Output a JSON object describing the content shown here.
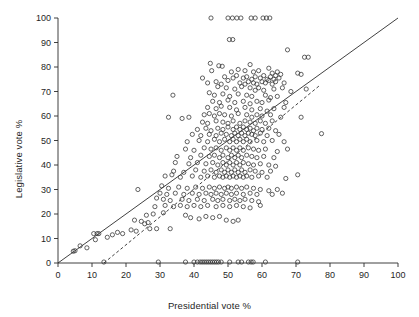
{
  "figure": {
    "background": "#ffffff",
    "ink_color": "#2b2b2b"
  },
  "axes": {
    "x_title": "Presidential vote %",
    "y_title": "Legislative vote %"
  },
  "chart_data": {
    "type": "scatter",
    "title": "",
    "xlabel": "Presidential vote %",
    "ylabel": "Legislative vote %",
    "xlim": [
      0,
      100
    ],
    "ylim": [
      0,
      100
    ],
    "xticks": [
      0,
      10,
      20,
      30,
      40,
      50,
      60,
      70,
      80,
      90,
      100
    ],
    "yticks": [
      0,
      10,
      20,
      30,
      40,
      50,
      60,
      70,
      80,
      90,
      100
    ],
    "xtick_labels": [
      "0",
      "10",
      "20",
      "30",
      "40",
      "50",
      "60",
      "70",
      "80",
      "90",
      "100"
    ],
    "ytick_labels": [
      "0",
      "10",
      "20",
      "30",
      "40",
      "50",
      "60",
      "70",
      "80",
      "90",
      "100"
    ],
    "grid": false,
    "legend": null,
    "marker": {
      "shape": "open-circle",
      "size_px": 4.2,
      "edge_color": "#3a3a3a",
      "fill": "none"
    },
    "reference_lines": [
      {
        "name": "identity-line",
        "style": "solid",
        "color": "#2b2b2b",
        "x": [
          0,
          100
        ],
        "y": [
          0,
          100
        ],
        "slope": 1.0,
        "intercept": 0.0
      },
      {
        "name": "regression-line",
        "style": "dashed",
        "color": "#2b2b2b",
        "x": [
          13.5,
          77.0
        ],
        "y": [
          0.0,
          72.5
        ],
        "slope": 1.142,
        "intercept": -15.4
      }
    ],
    "points": [
      [
        45.0,
        100
      ],
      [
        50.0,
        100
      ],
      [
        51.3,
        100
      ],
      [
        52.6,
        100
      ],
      [
        53.8,
        100
      ],
      [
        56.8,
        100
      ],
      [
        58.0,
        100
      ],
      [
        60.3,
        100
      ],
      [
        61.3,
        100
      ],
      [
        62.3,
        100
      ],
      [
        50.4,
        91.2
      ],
      [
        51.4,
        91.2
      ],
      [
        67.5,
        87.0
      ],
      [
        72.5,
        84.0
      ],
      [
        73.6,
        84.0
      ],
      [
        44.8,
        81.5
      ],
      [
        47.3,
        80.5
      ],
      [
        48.3,
        80.3
      ],
      [
        56.5,
        81.0
      ],
      [
        45.2,
        78.5
      ],
      [
        51.0,
        78.0
      ],
      [
        53.0,
        79.0
      ],
      [
        55.0,
        78.5
      ],
      [
        57.5,
        78.0
      ],
      [
        59.0,
        78.5
      ],
      [
        62.0,
        79.5
      ],
      [
        63.0,
        77.5
      ],
      [
        64.5,
        78.0
      ],
      [
        65.5,
        77.0
      ],
      [
        70.5,
        77.5
      ],
      [
        71.5,
        77.0
      ],
      [
        49.0,
        76.0
      ],
      [
        51.5,
        75.5
      ],
      [
        52.5,
        76.5
      ],
      [
        54.5,
        75.5
      ],
      [
        55.5,
        76.0
      ],
      [
        57.0,
        75.0
      ],
      [
        58.0,
        76.0
      ],
      [
        59.5,
        75.5
      ],
      [
        60.5,
        76.5
      ],
      [
        61.5,
        75.0
      ],
      [
        62.5,
        76.0
      ],
      [
        63.5,
        75.0
      ],
      [
        64.0,
        76.5
      ],
      [
        65.0,
        75.5
      ],
      [
        42.5,
        75.5
      ],
      [
        44.0,
        73.5
      ],
      [
        46.5,
        74.0
      ],
      [
        48.0,
        73.0
      ],
      [
        50.0,
        74.5
      ],
      [
        53.5,
        73.5
      ],
      [
        55.0,
        73.0
      ],
      [
        56.0,
        74.0
      ],
      [
        57.5,
        73.5
      ],
      [
        58.5,
        73.0
      ],
      [
        60.0,
        74.0
      ],
      [
        61.0,
        73.5
      ],
      [
        62.0,
        74.5
      ],
      [
        63.0,
        73.0
      ],
      [
        64.0,
        74.0
      ],
      [
        66.5,
        73.5
      ],
      [
        47.0,
        72.0
      ],
      [
        49.5,
        71.5
      ],
      [
        52.0,
        71.0
      ],
      [
        54.0,
        72.0
      ],
      [
        56.5,
        71.5
      ],
      [
        58.0,
        70.5
      ],
      [
        59.0,
        71.5
      ],
      [
        60.5,
        70.5
      ],
      [
        63.5,
        71.0
      ],
      [
        66.0,
        71.5
      ],
      [
        68.5,
        70.0
      ],
      [
        73.0,
        71.0
      ],
      [
        33.8,
        68.5
      ],
      [
        44.5,
        69.5
      ],
      [
        46.0,
        68.5
      ],
      [
        48.5,
        69.0
      ],
      [
        50.5,
        68.0
      ],
      [
        53.0,
        69.0
      ],
      [
        55.5,
        68.5
      ],
      [
        57.0,
        68.0
      ],
      [
        61.0,
        68.5
      ],
      [
        62.5,
        67.5
      ],
      [
        64.5,
        68.0
      ],
      [
        45.5,
        66.0
      ],
      [
        47.5,
        65.5
      ],
      [
        50.0,
        66.5
      ],
      [
        52.0,
        65.5
      ],
      [
        54.5,
        66.0
      ],
      [
        56.5,
        65.0
      ],
      [
        58.5,
        66.0
      ],
      [
        60.0,
        65.5
      ],
      [
        62.0,
        66.5
      ],
      [
        67.0,
        65.5
      ],
      [
        44.0,
        63.5
      ],
      [
        46.5,
        63.0
      ],
      [
        48.0,
        64.0
      ],
      [
        50.5,
        63.5
      ],
      [
        52.5,
        62.5
      ],
      [
        55.0,
        63.5
      ],
      [
        57.0,
        62.5
      ],
      [
        59.5,
        63.0
      ],
      [
        61.5,
        62.0
      ],
      [
        63.5,
        63.0
      ],
      [
        66.5,
        63.5
      ],
      [
        32.5,
        59.5
      ],
      [
        36.5,
        59.0
      ],
      [
        38.5,
        59.5
      ],
      [
        43.0,
        60.5
      ],
      [
        44.5,
        61.0
      ],
      [
        46.0,
        60.0
      ],
      [
        47.5,
        61.0
      ],
      [
        49.0,
        60.5
      ],
      [
        51.0,
        60.0
      ],
      [
        53.0,
        61.0
      ],
      [
        55.5,
        60.5
      ],
      [
        57.0,
        59.5
      ],
      [
        58.5,
        60.5
      ],
      [
        60.0,
        60.0
      ],
      [
        62.5,
        60.5
      ],
      [
        65.5,
        59.5
      ],
      [
        71.5,
        59.5
      ],
      [
        42.5,
        57.5
      ],
      [
        44.0,
        57.0
      ],
      [
        46.5,
        58.0
      ],
      [
        48.5,
        57.5
      ],
      [
        50.0,
        57.0
      ],
      [
        51.5,
        58.0
      ],
      [
        53.5,
        57.0
      ],
      [
        55.0,
        58.0
      ],
      [
        56.5,
        57.5
      ],
      [
        58.0,
        57.0
      ],
      [
        59.5,
        58.0
      ],
      [
        61.0,
        57.0
      ],
      [
        63.0,
        58.0
      ],
      [
        41.0,
        54.5
      ],
      [
        43.5,
        55.0
      ],
      [
        45.0,
        54.0
      ],
      [
        47.0,
        55.0
      ],
      [
        48.5,
        54.5
      ],
      [
        50.0,
        55.5
      ],
      [
        51.5,
        54.5
      ],
      [
        52.5,
        55.5
      ],
      [
        53.5,
        54.5
      ],
      [
        54.5,
        55.5
      ],
      [
        55.5,
        54.5
      ],
      [
        56.5,
        55.0
      ],
      [
        57.5,
        54.0
      ],
      [
        58.5,
        55.0
      ],
      [
        60.0,
        54.5
      ],
      [
        62.0,
        55.0
      ],
      [
        64.0,
        54.0
      ],
      [
        39.5,
        52.5
      ],
      [
        42.0,
        52.0
      ],
      [
        44.5,
        52.5
      ],
      [
        46.5,
        52.0
      ],
      [
        48.0,
        53.0
      ],
      [
        49.5,
        52.5
      ],
      [
        51.0,
        52.0
      ],
      [
        52.0,
        53.0
      ],
      [
        53.0,
        52.0
      ],
      [
        54.0,
        53.0
      ],
      [
        55.0,
        52.0
      ],
      [
        56.0,
        53.0
      ],
      [
        57.0,
        52.5
      ],
      [
        58.0,
        52.0
      ],
      [
        59.5,
        53.0
      ],
      [
        61.5,
        52.0
      ],
      [
        65.0,
        52.5
      ],
      [
        77.5,
        52.8
      ],
      [
        38.0,
        49.5
      ],
      [
        41.5,
        50.0
      ],
      [
        44.0,
        49.5
      ],
      [
        46.0,
        50.5
      ],
      [
        47.5,
        49.5
      ],
      [
        49.0,
        50.5
      ],
      [
        50.5,
        49.5
      ],
      [
        51.5,
        50.5
      ],
      [
        52.5,
        49.5
      ],
      [
        53.5,
        50.5
      ],
      [
        54.5,
        49.5
      ],
      [
        55.5,
        50.5
      ],
      [
        56.5,
        49.5
      ],
      [
        58.5,
        50.0
      ],
      [
        60.5,
        49.5
      ],
      [
        63.0,
        50.0
      ],
      [
        66.5,
        49.5
      ],
      [
        37.5,
        46.5
      ],
      [
        40.0,
        46.0
      ],
      [
        43.0,
        47.0
      ],
      [
        45.0,
        46.5
      ],
      [
        46.5,
        47.0
      ],
      [
        48.0,
        46.0
      ],
      [
        49.5,
        47.0
      ],
      [
        50.5,
        46.0
      ],
      [
        51.5,
        47.0
      ],
      [
        52.5,
        46.0
      ],
      [
        53.5,
        47.0
      ],
      [
        54.5,
        46.0
      ],
      [
        56.0,
        47.0
      ],
      [
        57.5,
        46.5
      ],
      [
        59.0,
        46.0
      ],
      [
        61.0,
        46.5
      ],
      [
        64.5,
        45.5
      ],
      [
        67.5,
        46.5
      ],
      [
        35.0,
        43.5
      ],
      [
        39.0,
        43.0
      ],
      [
        42.0,
        44.0
      ],
      [
        44.5,
        43.5
      ],
      [
        46.0,
        44.0
      ],
      [
        47.5,
        43.0
      ],
      [
        48.5,
        44.0
      ],
      [
        50.0,
        43.0
      ],
      [
        51.0,
        44.0
      ],
      [
        52.0,
        43.0
      ],
      [
        53.0,
        44.0
      ],
      [
        54.0,
        43.0
      ],
      [
        55.5,
        44.0
      ],
      [
        57.0,
        43.5
      ],
      [
        58.5,
        43.0
      ],
      [
        60.5,
        43.5
      ],
      [
        63.5,
        43.0
      ],
      [
        34.5,
        41.0
      ],
      [
        38.5,
        40.5
      ],
      [
        41.0,
        41.0
      ],
      [
        43.5,
        40.5
      ],
      [
        45.5,
        41.0
      ],
      [
        47.0,
        40.0
      ],
      [
        48.5,
        41.0
      ],
      [
        49.5,
        40.0
      ],
      [
        50.5,
        41.0
      ],
      [
        51.5,
        40.0
      ],
      [
        52.5,
        41.0
      ],
      [
        53.5,
        40.0
      ],
      [
        54.5,
        41.0
      ],
      [
        56.0,
        40.5
      ],
      [
        57.5,
        40.0
      ],
      [
        59.5,
        40.5
      ],
      [
        62.0,
        40.0
      ],
      [
        64.0,
        39.5
      ],
      [
        34.0,
        37.5
      ],
      [
        37.0,
        37.0
      ],
      [
        40.5,
        38.0
      ],
      [
        43.0,
        37.5
      ],
      [
        45.0,
        38.0
      ],
      [
        46.5,
        37.0
      ],
      [
        48.0,
        38.0
      ],
      [
        49.0,
        37.0
      ],
      [
        50.0,
        38.0
      ],
      [
        51.0,
        37.0
      ],
      [
        52.0,
        38.0
      ],
      [
        53.0,
        37.0
      ],
      [
        54.0,
        38.0
      ],
      [
        55.0,
        37.0
      ],
      [
        56.5,
        38.0
      ],
      [
        58.0,
        37.5
      ],
      [
        60.0,
        37.0
      ],
      [
        62.5,
        37.5
      ],
      [
        70.5,
        36.0
      ],
      [
        31.5,
        35.5
      ],
      [
        33.5,
        36.0
      ],
      [
        36.0,
        35.0
      ],
      [
        39.5,
        35.5
      ],
      [
        42.0,
        35.0
      ],
      [
        44.0,
        35.5
      ],
      [
        46.0,
        35.0
      ],
      [
        47.5,
        35.5
      ],
      [
        48.5,
        35.0
      ],
      [
        49.5,
        35.5
      ],
      [
        50.5,
        35.0
      ],
      [
        51.5,
        35.5
      ],
      [
        52.5,
        35.0
      ],
      [
        53.5,
        35.5
      ],
      [
        54.5,
        35.0
      ],
      [
        55.5,
        35.5
      ],
      [
        57.0,
        35.0
      ],
      [
        59.0,
        35.5
      ],
      [
        61.5,
        35.0
      ],
      [
        67.0,
        34.5
      ],
      [
        23.5,
        30.0
      ],
      [
        30.5,
        31.5
      ],
      [
        32.5,
        30.5
      ],
      [
        35.5,
        31.0
      ],
      [
        38.0,
        30.5
      ],
      [
        40.5,
        31.0
      ],
      [
        42.5,
        30.5
      ],
      [
        44.5,
        31.0
      ],
      [
        46.0,
        30.5
      ],
      [
        47.5,
        31.0
      ],
      [
        49.0,
        30.5
      ],
      [
        50.0,
        31.0
      ],
      [
        51.0,
        30.5
      ],
      [
        52.5,
        31.0
      ],
      [
        54.0,
        30.5
      ],
      [
        55.5,
        31.0
      ],
      [
        57.5,
        30.5
      ],
      [
        59.5,
        30.0
      ],
      [
        62.0,
        29.5
      ],
      [
        64.5,
        30.0
      ],
      [
        30.0,
        28.5
      ],
      [
        32.0,
        28.0
      ],
      [
        34.5,
        28.5
      ],
      [
        37.0,
        28.0
      ],
      [
        39.5,
        28.5
      ],
      [
        41.5,
        28.0
      ],
      [
        43.5,
        28.5
      ],
      [
        45.0,
        28.0
      ],
      [
        46.5,
        28.5
      ],
      [
        48.0,
        28.0
      ],
      [
        49.5,
        28.5
      ],
      [
        51.0,
        28.0
      ],
      [
        52.5,
        28.5
      ],
      [
        54.5,
        28.0
      ],
      [
        56.5,
        28.5
      ],
      [
        58.5,
        28.0
      ],
      [
        63.0,
        28.0
      ],
      [
        66.0,
        28.5
      ],
      [
        29.0,
        26.5
      ],
      [
        31.0,
        26.0
      ],
      [
        33.0,
        25.5
      ],
      [
        36.5,
        26.0
      ],
      [
        38.5,
        25.5
      ],
      [
        41.0,
        26.0
      ],
      [
        43.0,
        25.5
      ],
      [
        45.5,
        26.0
      ],
      [
        47.0,
        25.5
      ],
      [
        48.5,
        26.0
      ],
      [
        50.5,
        25.5
      ],
      [
        52.0,
        26.0
      ],
      [
        53.5,
        25.5
      ],
      [
        55.0,
        26.0
      ],
      [
        57.0,
        25.5
      ],
      [
        59.0,
        25.0
      ],
      [
        28.5,
        23.0
      ],
      [
        31.5,
        23.5
      ],
      [
        34.0,
        23.0
      ],
      [
        36.0,
        23.5
      ],
      [
        38.0,
        23.0
      ],
      [
        40.0,
        23.5
      ],
      [
        42.0,
        23.0
      ],
      [
        44.0,
        23.5
      ],
      [
        46.5,
        23.0
      ],
      [
        48.5,
        23.5
      ],
      [
        50.5,
        23.0
      ],
      [
        52.5,
        23.5
      ],
      [
        54.5,
        23.0
      ],
      [
        56.5,
        22.5
      ],
      [
        59.5,
        23.5
      ],
      [
        26.0,
        19.5
      ],
      [
        28.0,
        20.0
      ],
      [
        31.0,
        20.5
      ],
      [
        37.5,
        19.5
      ],
      [
        39.0,
        18.5
      ],
      [
        41.5,
        18.0
      ],
      [
        43.5,
        19.0
      ],
      [
        45.5,
        18.5
      ],
      [
        47.5,
        19.0
      ],
      [
        49.5,
        17.5
      ],
      [
        51.5,
        17.0
      ],
      [
        53.0,
        17.5
      ],
      [
        22.5,
        17.5
      ],
      [
        24.5,
        17.0
      ],
      [
        26.5,
        16.5
      ],
      [
        25.5,
        16.0
      ],
      [
        27.0,
        14.0
      ],
      [
        29.0,
        14.0
      ],
      [
        33.0,
        14.0
      ],
      [
        21.5,
        13.5
      ],
      [
        23.0,
        13.0
      ],
      [
        17.5,
        12.5
      ],
      [
        19.0,
        12.0
      ],
      [
        16.0,
        11.5
      ],
      [
        14.5,
        10.5
      ],
      [
        12.0,
        12.0
      ],
      [
        11.5,
        12.0
      ],
      [
        10.5,
        12.0
      ],
      [
        11.0,
        9.5
      ],
      [
        8.5,
        6.2
      ],
      [
        6.5,
        7.0
      ],
      [
        5.0,
        5.0
      ],
      [
        4.5,
        4.8
      ],
      [
        13.5,
        0.4
      ],
      [
        29.5,
        0.4
      ],
      [
        37.5,
        0.4
      ],
      [
        40.0,
        0.4
      ],
      [
        41.0,
        0.4
      ],
      [
        41.8,
        0.4
      ],
      [
        42.4,
        0.4
      ],
      [
        43.0,
        0.4
      ],
      [
        43.6,
        0.4
      ],
      [
        44.2,
        0.4
      ],
      [
        44.8,
        0.4
      ],
      [
        45.4,
        0.4
      ],
      [
        46.0,
        0.4
      ],
      [
        46.6,
        0.4
      ],
      [
        47.2,
        0.4
      ],
      [
        48.0,
        0.4
      ],
      [
        50.5,
        0.4
      ],
      [
        53.0,
        0.4
      ],
      [
        54.0,
        0.4
      ],
      [
        56.0,
        0.4
      ],
      [
        56.8,
        0.4
      ],
      [
        57.4,
        0.4
      ],
      [
        61.0,
        0.4
      ],
      [
        70.5,
        0.4
      ]
    ]
  }
}
